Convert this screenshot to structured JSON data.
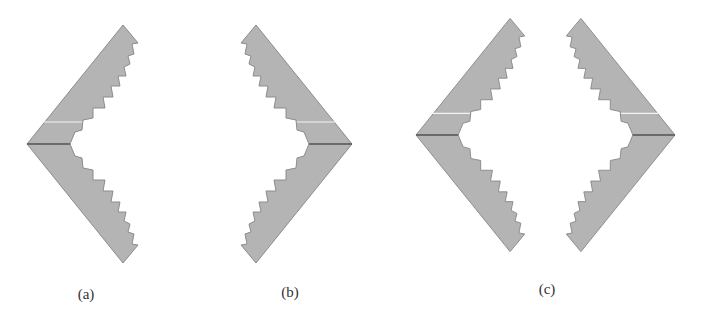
{
  "figure": {
    "panels": [
      {
        "id": "a",
        "label": "(a)",
        "label_pos": [
          86,
          286
        ],
        "description": "left-pointing serrated chevron"
      },
      {
        "id": "b",
        "label": "(b)",
        "label_pos": [
          290,
          284
        ],
        "description": "right-pointing serrated chevron"
      },
      {
        "id": "c",
        "label": "(c)",
        "label_pos": [
          547,
          281
        ],
        "description": "pair of facing serrated chevrons forming a diamond"
      }
    ],
    "colors": {
      "fill": "#b4b4b4",
      "edge": "#8c8c8c",
      "midline": "#5a5a5a",
      "highlight": "#f4f4f4"
    }
  },
  "shapes": [
    {
      "name": "chevron-a",
      "tip": [
        27,
        144
      ],
      "dir": -1,
      "scale": 1.0
    },
    {
      "name": "chevron-b",
      "tip": [
        352,
        144
      ],
      "dir": 1,
      "scale": 1.0
    },
    {
      "name": "chevron-c-left",
      "tip": [
        416,
        135
      ],
      "dir": -1,
      "scale": 0.98
    },
    {
      "name": "chevron-c-right",
      "tip": [
        675,
        135
      ],
      "dir": 1,
      "scale": 0.98
    }
  ]
}
